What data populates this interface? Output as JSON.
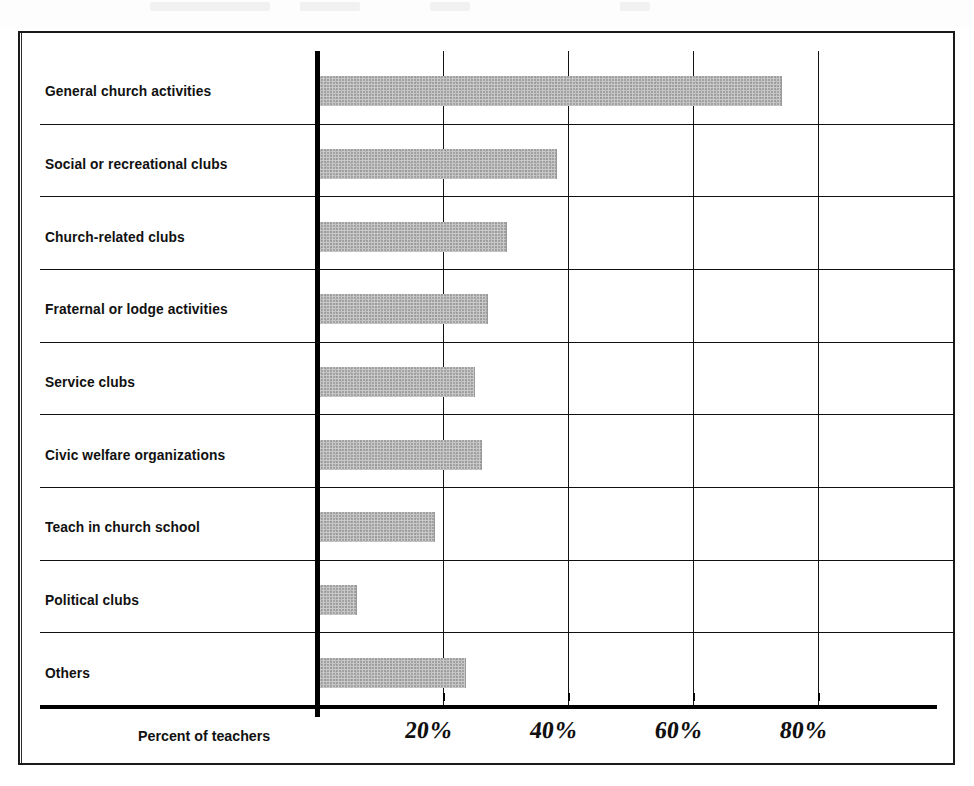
{
  "chart_data": {
    "type": "bar",
    "orientation": "horizontal",
    "title": "",
    "xlabel": "Percent of teachers",
    "ylabel": "",
    "xlim": [
      0,
      100
    ],
    "xticks": [
      20,
      40,
      60,
      80
    ],
    "xtick_labels": [
      "20%",
      "40%",
      "60%",
      "80%"
    ],
    "grid": true,
    "legend": false,
    "categories": [
      "General church activities",
      "Social or recreational clubs",
      "Church-related clubs",
      "Fraternal or lodge activities",
      "Service clubs",
      "Civic welfare organizations",
      "Teach in church school",
      "Political clubs",
      "Others"
    ],
    "values": [
      74,
      38,
      30,
      27,
      25,
      26,
      18.5,
      6,
      23.5
    ],
    "bar_color": "#c9c9c9",
    "axis_color": "#000000"
  },
  "axis": {
    "title": "Percent of teachers",
    "ticks": [
      {
        "label": "20%",
        "value": 20
      },
      {
        "label": "40%",
        "value": 40
      },
      {
        "label": "60%",
        "value": 60
      },
      {
        "label": "80%",
        "value": 80
      }
    ]
  },
  "rows": [
    {
      "label": "General church activities",
      "value": 74
    },
    {
      "label": "Social or recreational clubs",
      "value": 38
    },
    {
      "label": "Church-related clubs",
      "value": 30
    },
    {
      "label": "Fraternal or lodge activities",
      "value": 27
    },
    {
      "label": "Service clubs",
      "value": 25
    },
    {
      "label": "Civic welfare organizations",
      "value": 26
    },
    {
      "label": "Teach in church school",
      "value": 18.5
    },
    {
      "label": "Political clubs",
      "value": 6
    },
    {
      "label": "Others",
      "value": 23.5
    }
  ],
  "colors": {
    "bar": "#c9c9c9",
    "ink": "#111111",
    "paper": "#ffffff"
  }
}
